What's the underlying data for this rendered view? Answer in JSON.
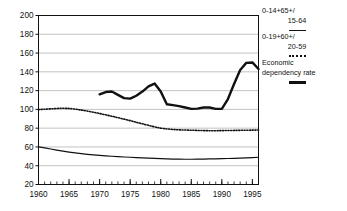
{
  "chart_data": {
    "type": "line",
    "title": "",
    "xlabel": "",
    "ylabel": "",
    "xlim": [
      1960,
      1996
    ],
    "ylim": [
      20,
      200
    ],
    "ytick_step": 20,
    "yticks": [
      20,
      40,
      60,
      80,
      100,
      120,
      140,
      160,
      180,
      200
    ],
    "xticks": [
      1960,
      1965,
      1970,
      1975,
      1980,
      1985,
      1990,
      1995
    ],
    "xtick_labels": [
      "1960",
      "1965",
      "1970",
      "1975",
      "1980",
      "1985",
      "1990",
      "1995"
    ],
    "ytick_labels": [
      "20",
      "40",
      "60",
      "80",
      "100",
      "120",
      "140",
      "160",
      "180",
      "200"
    ],
    "minor_xticks_every": 1,
    "grid": "horizontal",
    "legend_position": "right-outside",
    "series": [
      {
        "name": "0-14+65+/ 15-64",
        "style": "thin-solid",
        "color": "#111111",
        "x": [
          1960,
          1961,
          1962,
          1963,
          1964,
          1965,
          1966,
          1967,
          1968,
          1969,
          1970,
          1971,
          1972,
          1973,
          1974,
          1975,
          1976,
          1977,
          1978,
          1979,
          1980,
          1981,
          1982,
          1983,
          1984,
          1985,
          1986,
          1987,
          1988,
          1989,
          1990,
          1991,
          1992,
          1993,
          1994,
          1995,
          1996
        ],
        "values": [
          60.0,
          59.0,
          57.8,
          56.6,
          55.5,
          54.5,
          53.6,
          52.8,
          52.1,
          51.5,
          51.0,
          50.5,
          50.1,
          49.7,
          49.3,
          49.0,
          48.7,
          48.4,
          48.1,
          47.8,
          47.5,
          47.3,
          47.1,
          47.0,
          46.9,
          46.9,
          47.0,
          47.1,
          47.2,
          47.3,
          47.5,
          47.7,
          47.9,
          48.1,
          48.4,
          48.7,
          49.0
        ]
      },
      {
        "name": "0-19+60+/ 20-59",
        "style": "dotted",
        "color": "#111111",
        "x": [
          1960,
          1961,
          1962,
          1963,
          1964,
          1965,
          1966,
          1967,
          1968,
          1969,
          1970,
          1971,
          1972,
          1973,
          1974,
          1975,
          1976,
          1977,
          1978,
          1979,
          1980,
          1981,
          1982,
          1983,
          1984,
          1985,
          1986,
          1987,
          1988,
          1989,
          1990,
          1991,
          1992,
          1993,
          1994,
          1995,
          1996
        ],
        "values": [
          99.8,
          100.2,
          100.6,
          101.0,
          101.2,
          101.0,
          100.3,
          99.3,
          98.2,
          97.0,
          95.6,
          94.2,
          92.7,
          91.2,
          89.6,
          88.0,
          86.3,
          84.6,
          83.0,
          81.4,
          80.0,
          79.2,
          78.6,
          78.2,
          78.0,
          77.8,
          77.6,
          77.4,
          77.3,
          77.3,
          77.4,
          77.5,
          77.6,
          77.7,
          77.8,
          77.9,
          78.0
        ]
      },
      {
        "name": "Economic dependency rate",
        "style": "thick-solid",
        "color": "#111111",
        "x": [
          1970,
          1971,
          1972,
          1973,
          1974,
          1975,
          1976,
          1977,
          1978,
          1979,
          1980,
          1981,
          1982,
          1983,
          1984,
          1985,
          1986,
          1987,
          1988,
          1989,
          1990,
          1991,
          1992,
          1993,
          1994,
          1995,
          1996
        ],
        "values": [
          116.0,
          118.5,
          119.0,
          115.5,
          112.0,
          111.5,
          114.5,
          119.0,
          124.5,
          127.5,
          119.0,
          105.5,
          104.5,
          103.5,
          102.0,
          100.5,
          100.8,
          102.0,
          102.0,
          100.5,
          100.5,
          111.0,
          127.0,
          142.0,
          149.5,
          150.0,
          143.0
        ]
      }
    ]
  },
  "legend": {
    "entries": [
      {
        "line1": "0-14+65+/",
        "line2": "15-64",
        "marker": "thin-solid"
      },
      {
        "line1": "0-19+60+/",
        "line2": "20-59",
        "marker": "dotted"
      },
      {
        "line1": "Economic",
        "line2": "dependency rate",
        "marker": "thick-solid"
      }
    ]
  }
}
